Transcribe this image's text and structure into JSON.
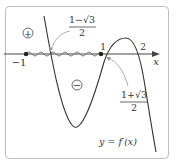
{
  "diagram": {
    "type": "function-graph",
    "curve_label": "y = f′(x)",
    "axis_label": "x",
    "tick_labels": {
      "minus_one": "−1",
      "one": "1",
      "two": "2"
    },
    "sign_markers": {
      "positive": "+",
      "negative": "−"
    },
    "annotations": {
      "root_left": {
        "numerator": "1−√3",
        "denominator": "2"
      },
      "root_right": {
        "numerator": "1+√3",
        "denominator": "2"
      }
    },
    "colors": {
      "line": "#333333",
      "frame": "#bbbbbb",
      "arrow": "#999999"
    }
  }
}
